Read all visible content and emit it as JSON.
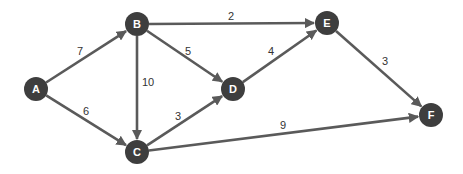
{
  "graph": {
    "type": "directed-weighted",
    "nodes": [
      {
        "id": "A",
        "label": "A",
        "x": 36,
        "y": 89
      },
      {
        "id": "B",
        "label": "B",
        "x": 137,
        "y": 24
      },
      {
        "id": "C",
        "label": "C",
        "x": 137,
        "y": 152
      },
      {
        "id": "D",
        "label": "D",
        "x": 233,
        "y": 89
      },
      {
        "id": "E",
        "label": "E",
        "x": 327,
        "y": 23
      },
      {
        "id": "F",
        "label": "F",
        "x": 431,
        "y": 115
      }
    ],
    "edges": [
      {
        "from": "A",
        "to": "B",
        "weight": "7",
        "lx": 80,
        "ly": 51
      },
      {
        "from": "A",
        "to": "C",
        "weight": "6",
        "lx": 86,
        "ly": 111
      },
      {
        "from": "B",
        "to": "E",
        "weight": "2",
        "lx": 231,
        "ly": 16
      },
      {
        "from": "B",
        "to": "D",
        "weight": "5",
        "lx": 188,
        "ly": 51
      },
      {
        "from": "B",
        "to": "C",
        "weight": "10",
        "lx": 148,
        "ly": 82
      },
      {
        "from": "C",
        "to": "D",
        "weight": "3",
        "lx": 178,
        "ly": 116
      },
      {
        "from": "D",
        "to": "E",
        "weight": "4",
        "lx": 271,
        "ly": 51
      },
      {
        "from": "E",
        "to": "F",
        "weight": "3",
        "lx": 385,
        "ly": 61
      },
      {
        "from": "C",
        "to": "F",
        "weight": "9",
        "lx": 283,
        "ly": 125
      }
    ]
  },
  "colors": {
    "node": "#3e3e3e",
    "edge": "#5a5a5a",
    "label": "#ffffff",
    "weight": "#333333"
  }
}
